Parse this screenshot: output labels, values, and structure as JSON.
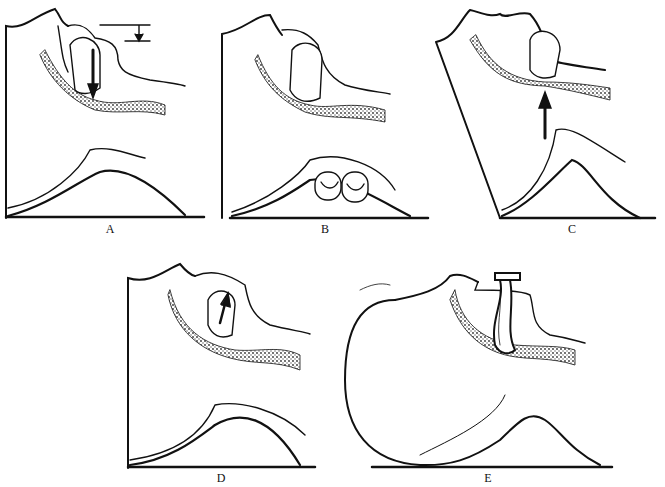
{
  "figure": {
    "panels": [
      {
        "id": "A",
        "label": "A",
        "arrow": "down",
        "annotation": "dimension-marker"
      },
      {
        "id": "B",
        "label": "B",
        "object": "pillow-rolls"
      },
      {
        "id": "C",
        "label": "C",
        "arrow": "up"
      },
      {
        "id": "D",
        "label": "D",
        "arrow": "up-diagonal"
      },
      {
        "id": "E",
        "label": "E",
        "object": "oral-airway"
      }
    ],
    "colors": {
      "ink": "#111111",
      "stipple": "#555555",
      "background": "#ffffff"
    }
  }
}
